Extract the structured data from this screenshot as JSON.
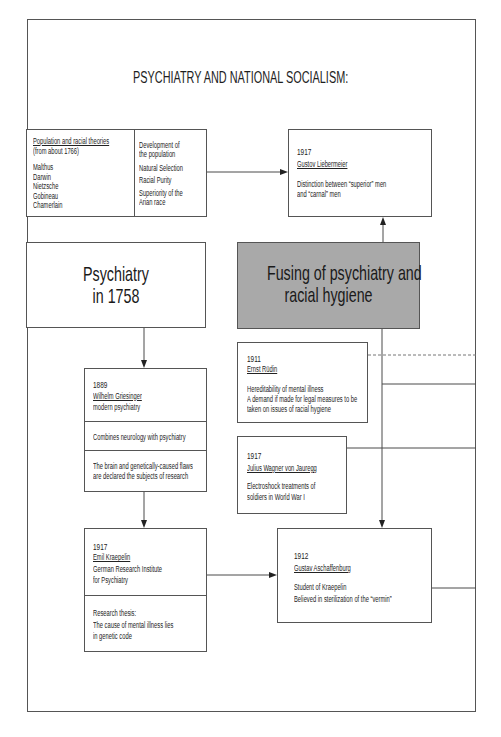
{
  "title": "PSYCHIATRY AND NATIONAL SOCIALISM:",
  "colors": {
    "line": "#4a4a4a",
    "text": "#222222",
    "highlight_fill": "#a9a9a9",
    "background": "#ffffff"
  },
  "theories": {
    "heading": "Population and racial theories",
    "subheading": "(from about 1766)",
    "names": [
      "Malthus",
      "Darwin",
      "Nietzsche",
      "Gobineau",
      "Chamerlain"
    ],
    "concepts": [
      [
        "Development of",
        "the population"
      ],
      [
        "Natural Selection"
      ],
      [
        "Racial Purity"
      ],
      [
        "Superiority of the",
        "Arian race"
      ]
    ]
  },
  "liebermeier": {
    "year": "1917",
    "name": "Gustov Liebermeier",
    "description": [
      "Distinction between “superior” men",
      "and “carnal” men"
    ]
  },
  "psychiatry_1758": {
    "lines": [
      "Psychiatry",
      "in 1758"
    ]
  },
  "fusing": {
    "lines": [
      "Fusing of psychiatry and",
      "racial hygiene"
    ]
  },
  "griesinger": {
    "year": "1889",
    "name": "Wilhelm Griesinger",
    "role": "modern psychiatry",
    "contribution": "Combines neurology with psychiatry",
    "research": [
      "The brain and genetically-caused flaws",
      "are declared the subjects of research"
    ]
  },
  "kraepelin": {
    "year": "1917",
    "name": "Emil Kraepelin",
    "institution": [
      "German Research Institute",
      "for Psychiatry"
    ],
    "thesis": [
      "Research thesis:",
      "The cause of mental illness lies",
      "in genetic code"
    ]
  },
  "rudin": {
    "year": "1911",
    "name": "Ernst Rüdin",
    "description": [
      "Hereditability of mental illness",
      "A demand if made for legal measures to be",
      "taken on issues of racial hygiene"
    ]
  },
  "wagner": {
    "year": "1917",
    "name": "Julius Wagner von Jauregg",
    "description": [
      "Electroshock treatments of",
      "soldiers in World War I"
    ]
  },
  "aschaffenburg": {
    "year": "1912",
    "name": "Gustav Aschaffenburg",
    "description": [
      "Student of Kraepelin",
      "Believed in sterilization of the “vermin”"
    ]
  }
}
